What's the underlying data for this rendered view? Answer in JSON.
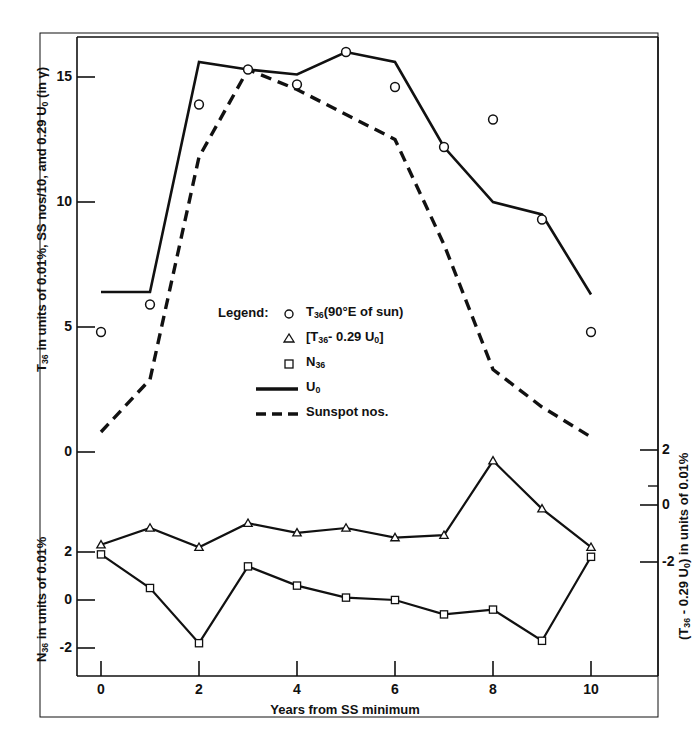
{
  "figure": {
    "x_axis_title": "Years from SS minimum",
    "y_axis_left_top": "T36 in units of 0.01%, SS nos/10, and 0.29 U0 (in γ)",
    "y_axis_left_bottom": "N36 in units of 0.01%",
    "y_axis_right": "(T36 - 0.29 U0) in units of 0.01%",
    "legend_title": "Legend:",
    "ink_color": "#111111",
    "background": "#ffffff"
  },
  "legend": {
    "title": "Legend:",
    "entries": [
      {
        "marker": "circle-marker",
        "label_html": "T<sub>36</sub>(90°E of sun)",
        "label": "T36(90°E of sun)"
      },
      {
        "marker": "triangle-marker",
        "label_html": "[T<sub>36</sub>- 0.29 U<sub>0</sub>]",
        "label": "[T36 - 0.29 U0]"
      },
      {
        "marker": "square-marker",
        "label_html": "N<sub>36</sub>",
        "label": "N36"
      },
      {
        "marker": "solid-line-swatch",
        "label_html": "U<sub>0</sub>",
        "label": "U0"
      },
      {
        "marker": "dashed-line-swatch",
        "label_html": "Sunspot nos.",
        "label": "Sunspot nos."
      }
    ]
  },
  "ticks": {
    "x": [
      "0",
      "2",
      "4",
      "6",
      "8",
      "10"
    ],
    "y_top_left": [
      "15",
      "10",
      "5",
      "0"
    ],
    "y_bottom_left": [
      "2",
      "0",
      "-2"
    ],
    "y_right": [
      "2",
      "0",
      "-2"
    ]
  },
  "chart_data": {
    "type": "line",
    "title": "",
    "xlabel": "Years from SS minimum",
    "ylabel": "T36 in units of 0.01%, SS nos/10, and 0.29 U0 (in γ)",
    "ylabel_secondary": "(T36 - 0.29 U0) in units of 0.01%",
    "ylabel_lower": "N36 in units of 0.01%",
    "x": [
      0,
      1,
      2,
      3,
      4,
      5,
      6,
      7,
      8,
      9,
      10
    ],
    "grid": false,
    "legend_position": "inside-center",
    "panels": [
      {
        "name": "upper-panel",
        "ylim": [
          0,
          17
        ],
        "yticks": [
          0,
          5,
          10,
          15
        ],
        "series": [
          {
            "name": "T36(90°E of sun)",
            "marker": "circle",
            "line": "none",
            "values": [
              4.8,
              5.9,
              13.9,
              15.3,
              14.7,
              16.0,
              14.6,
              12.2,
              13.3,
              9.3,
              4.8
            ]
          },
          {
            "name": "U0",
            "marker": "none",
            "line": "solid",
            "values": [
              6.4,
              6.4,
              15.6,
              15.3,
              15.1,
              16.0,
              15.6,
              12.2,
              10.0,
              9.5,
              6.3
            ]
          },
          {
            "name": "Sunspot nos.",
            "marker": "none",
            "line": "dashed",
            "values": [
              0.8,
              2.9,
              11.8,
              15.3,
              14.5,
              13.5,
              12.5,
              8.3,
              3.3,
              1.8,
              0.6
            ]
          }
        ]
      },
      {
        "name": "lower-panel",
        "ylim": [
          -3,
          3
        ],
        "yticks": [
          -2,
          0,
          2
        ],
        "series": [
          {
            "name": "[T36 - 0.29 U0]",
            "marker": "triangle",
            "line": "solid",
            "values": [
              2.3,
              3.0,
              2.2,
              3.2,
              2.8,
              3.0,
              2.6,
              2.7,
              5.8,
              3.8,
              2.2
            ]
          },
          {
            "name": "N36",
            "marker": "square",
            "line": "solid",
            "values": [
              1.9,
              0.5,
              -1.8,
              1.4,
              0.6,
              0.1,
              0.0,
              -0.6,
              -0.4,
              -1.7,
              1.8
            ]
          }
        ]
      }
    ]
  }
}
